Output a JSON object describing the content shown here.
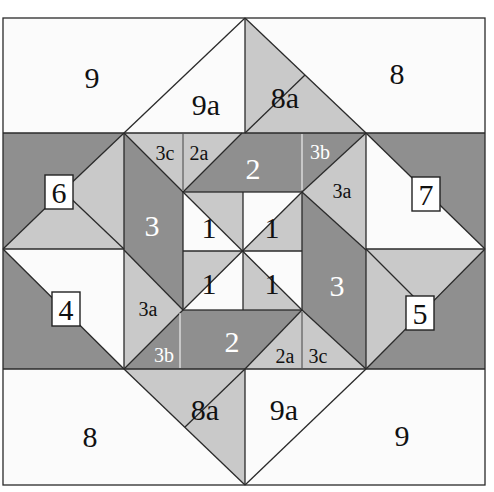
{
  "diagram": {
    "type": "quilt-block-piecing-diagram",
    "colors": {
      "white": "#fbfbfb",
      "light_gray": "#c9c9c9",
      "dark_gray": "#8f8f8f",
      "line": "#2a2a2a"
    },
    "labels": {
      "top_left_corner": "9",
      "top_left_triangle": "9a",
      "top_right_triangle": "8a",
      "top_right_corner": "8",
      "bottom_left_corner": "8",
      "bottom_left_triangle": "8a",
      "bottom_right_triangle": "9a",
      "bottom_right_corner": "9",
      "left_upper_box": "6",
      "right_upper_box": "7",
      "left_lower_box": "4",
      "right_lower_box": "5",
      "top_3c": "3c",
      "top_2a": "2a",
      "top_2": "2",
      "top_3b": "3b",
      "top_3a": "3a",
      "left_3": "3",
      "right_3": "3",
      "bottom_3a": "3a",
      "bottom_3b": "3b",
      "bottom_2": "2",
      "bottom_2a": "2a",
      "bottom_3c": "3c",
      "center_tl": "1",
      "center_tr": "1",
      "center_bl": "1",
      "center_br": "1"
    }
  }
}
